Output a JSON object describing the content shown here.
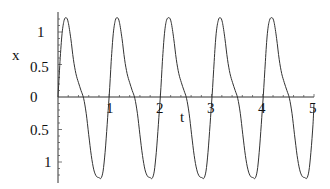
{
  "chart_data": {
    "type": "line",
    "title": "",
    "xlabel": "t",
    "ylabel": "x",
    "xlim": [
      0,
      5
    ],
    "ylim": [
      -1.27,
      1.27
    ],
    "grid": false,
    "legend": null,
    "x_ticks": [
      "1",
      "2",
      "3",
      "4",
      "5"
    ],
    "y_ticks_positive": [
      "1",
      "0.5"
    ],
    "y_tick_zero": "0",
    "y_ticks_negative_as_rendered": [
      "0.5",
      "1"
    ],
    "y_ticks_values": [
      1,
      0.5,
      0,
      -0.5,
      -1
    ],
    "line_color": "#333333",
    "period": 1.0,
    "peak_value": 1.22,
    "trough_value": -1.25,
    "peaks_t": [
      0.16,
      1.16,
      2.17,
      3.17,
      4.18
    ],
    "troughs_t": [
      0.84,
      1.84,
      2.85,
      3.85,
      4.86
    ],
    "series": [
      {
        "name": "x(t)",
        "t": [
          0,
          0.04,
          0.08,
          0.12,
          0.16,
          0.2,
          0.25,
          0.3,
          0.35,
          0.4,
          0.45,
          0.5,
          0.55,
          0.6,
          0.65,
          0.7,
          0.75,
          0.8,
          0.84,
          0.88,
          0.92,
          0.96,
          1.0,
          1.04,
          1.08,
          1.12,
          1.16,
          1.2,
          1.25,
          1.3,
          1.35,
          1.4,
          1.45,
          1.5,
          1.55,
          1.6,
          1.65,
          1.7,
          1.75,
          1.8,
          1.84,
          1.88,
          1.92,
          1.96,
          2.0,
          2.04,
          2.08,
          2.12,
          2.17,
          2.21,
          2.26,
          2.31,
          2.36,
          2.41,
          2.46,
          2.51,
          2.56,
          2.61,
          2.66,
          2.71,
          2.76,
          2.81,
          2.85,
          2.89,
          2.93,
          2.97,
          3.01,
          3.05,
          3.09,
          3.13,
          3.17,
          3.21,
          3.26,
          3.31,
          3.36,
          3.41,
          3.46,
          3.51,
          3.56,
          3.61,
          3.66,
          3.71,
          3.76,
          3.81,
          3.85,
          3.89,
          3.93,
          3.97,
          4.01,
          4.05,
          4.09,
          4.13,
          4.18,
          4.22,
          4.27,
          4.32,
          4.37,
          4.42,
          4.47,
          4.52,
          4.57,
          4.62,
          4.67,
          4.72,
          4.77,
          4.82,
          4.86,
          4.9,
          4.94,
          4.98,
          5.0
        ],
        "x": [
          0,
          0.55,
          0.98,
          1.18,
          1.22,
          1.15,
          0.9,
          0.58,
          0.36,
          0.22,
          0.1,
          -0.02,
          -0.25,
          -0.58,
          -0.9,
          -1.12,
          -1.22,
          -1.24,
          -1.25,
          -1.14,
          -0.85,
          -0.42,
          0.02,
          0.55,
          0.98,
          1.18,
          1.22,
          1.15,
          0.9,
          0.58,
          0.36,
          0.22,
          0.1,
          -0.02,
          -0.25,
          -0.58,
          -0.9,
          -1.12,
          -1.22,
          -1.24,
          -1.25,
          -1.14,
          -0.85,
          -0.42,
          0.02,
          0.55,
          0.98,
          1.18,
          1.22,
          1.15,
          0.9,
          0.58,
          0.36,
          0.22,
          0.1,
          -0.02,
          -0.25,
          -0.58,
          -0.9,
          -1.12,
          -1.22,
          -1.24,
          -1.25,
          -1.14,
          -0.85,
          -0.42,
          0.02,
          0.55,
          0.98,
          1.18,
          1.22,
          1.15,
          0.9,
          0.58,
          0.36,
          0.22,
          0.1,
          -0.02,
          -0.25,
          -0.58,
          -0.9,
          -1.12,
          -1.22,
          -1.24,
          -1.25,
          -1.14,
          -0.85,
          -0.42,
          0.02,
          0.55,
          0.98,
          1.18,
          1.22,
          1.15,
          0.9,
          0.58,
          0.36,
          0.22,
          0.1,
          -0.02,
          -0.25,
          -0.58,
          -0.9,
          -1.12,
          -1.22,
          -1.24,
          -1.25,
          -1.14,
          -0.85,
          -0.42,
          -0.1
        ]
      }
    ]
  },
  "labels": {
    "x_axis": "t",
    "y_axis": "x",
    "zero": "0",
    "y_pos_1": "1",
    "y_pos_05": "0.5",
    "y_neg_05": "0.5",
    "y_neg_1": "1",
    "t1": "1",
    "t2": "2",
    "t3": "3",
    "t4": "4",
    "t5": "5"
  }
}
